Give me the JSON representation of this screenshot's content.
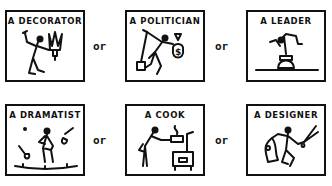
{
  "rows": [
    {
      "panels": [
        {
          "caption": "A DECORATOR",
          "icon": "decorator-figure-icon"
        },
        {
          "caption": "A POLITICIAN",
          "icon": "politician-figure-icon"
        },
        {
          "caption": "A LEADER",
          "icon": "leader-figure-icon"
        }
      ],
      "separators": [
        "or",
        "or"
      ]
    },
    {
      "panels": [
        {
          "caption": "A DRAMATIST",
          "icon": "dramatist-figure-icon"
        },
        {
          "caption": "A COOK",
          "icon": "cook-figure-icon"
        },
        {
          "caption": "A DESIGNER",
          "icon": "designer-figure-icon"
        }
      ],
      "separators": [
        "or",
        "or"
      ]
    }
  ],
  "colors": {
    "ink": "#111111",
    "paper": "#ffffff"
  }
}
